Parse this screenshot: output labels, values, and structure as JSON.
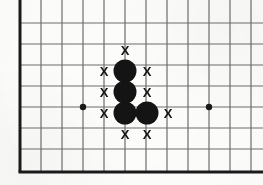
{
  "figure": {
    "kind": "go-board-diagram",
    "board": {
      "background_color": "#fdfdfc",
      "line_color": "#6e6e6e",
      "edge_color": "#1a1a1a",
      "origin_x": 20,
      "origin_y": 23,
      "bottom_edge_y": 172,
      "spacing": 21,
      "columns": 11,
      "rows": 7,
      "edge_thickness": 3,
      "line_thickness": 1.2
    },
    "star_points": {
      "name": "hoshi",
      "color": "#1a1a1a",
      "radius": 3.2,
      "points": [
        {
          "x": 83,
          "y": 107
        },
        {
          "x": 209,
          "y": 107
        }
      ]
    },
    "stones": {
      "color": "#141414",
      "radius": 11.5,
      "count": 5,
      "items": [
        {
          "label": "stone-1",
          "x": 125,
          "y": 71
        },
        {
          "label": "stone-2",
          "x": 125,
          "y": 92
        },
        {
          "label": "stone-3",
          "x": 125,
          "y": 113
        },
        {
          "label": "stone-4",
          "x": 147,
          "y": 113
        },
        {
          "label": "stone-5",
          "x": 125,
          "y": 71
        }
      ]
    },
    "liberty_marks": {
      "glyph": "X",
      "color": "#141414",
      "size": 13,
      "count": 10,
      "items": [
        {
          "label": "liberty-top",
          "x": 125,
          "y": 50
        },
        {
          "label": "liberty-upper-left",
          "x": 104,
          "y": 71
        },
        {
          "label": "liberty-upper-right",
          "x": 147,
          "y": 71
        },
        {
          "label": "liberty-mid-left",
          "x": 104,
          "y": 92
        },
        {
          "label": "liberty-mid-right",
          "x": 147,
          "y": 92
        },
        {
          "label": "liberty-lower-left",
          "x": 104,
          "y": 113
        },
        {
          "label": "liberty-right",
          "x": 168,
          "y": 113
        },
        {
          "label": "liberty-bottom-left",
          "x": 125,
          "y": 134
        },
        {
          "label": "liberty-bottom-right",
          "x": 147,
          "y": 134
        },
        {
          "label": "liberty-spare",
          "x": 125,
          "y": 50
        }
      ]
    }
  }
}
